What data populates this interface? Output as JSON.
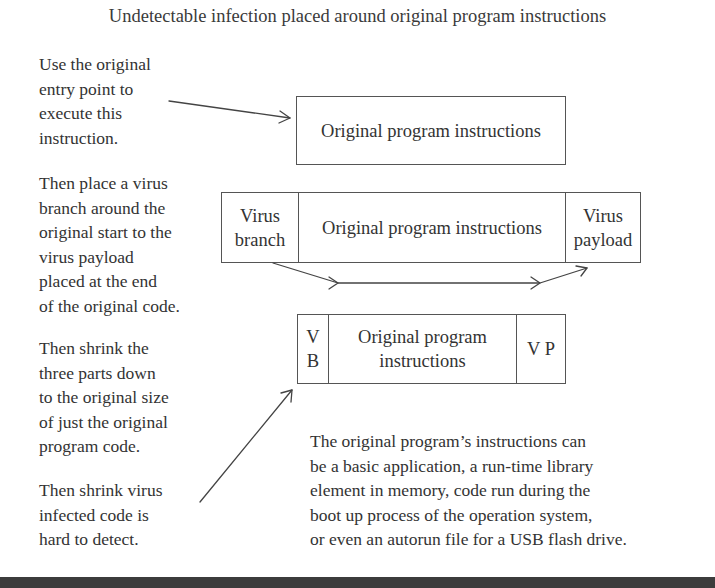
{
  "title": "Undetectable infection placed around original program instructions",
  "notes": [
    "Use the original\nentry point to\nexecute this\ninstruction.",
    "Then place a virus\nbranch around the\noriginal start to the\nvirus payload\nplaced at the end\nof the original code.",
    "Then shrink the\nthree parts down\nto the original size\nof just the original\nprogram code.",
    "Then shrink virus\ninfected code is\nhard to detect."
  ],
  "boxes": {
    "original": {
      "label": "Original program instructions"
    },
    "infected": {
      "virus_branch": "Virus\nbranch",
      "program": "Original program instructions",
      "virus_payload": "Virus\npayload"
    },
    "shrunk": {
      "vb": "V\nB",
      "program": "Original program\ninstructions",
      "vp": "V P"
    }
  },
  "description": "The original program’s instructions can\nbe a basic application, a run-time library\nelement in memory, code run during the\nboot up process of the operation system,\nor even an autorun file for a USB flash drive.",
  "colors": {
    "text": "#333333",
    "lines": "#555555",
    "bottom_bar": "#3c3c3c"
  }
}
